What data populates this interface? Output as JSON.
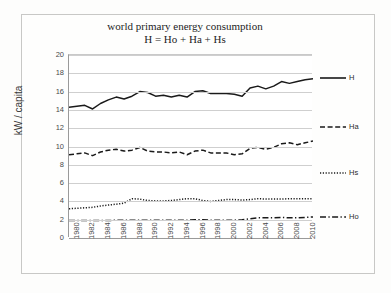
{
  "chart_data": {
    "type": "line",
    "title": "world primary energy consumption",
    "subtitle": "H = Ho + Ha + Hs",
    "xlabel": "",
    "ylabel": "kW / capita",
    "ylim": [
      0,
      20
    ],
    "xlim": [
      1980,
      2011
    ],
    "ytick_step": 2,
    "yticks": [
      "20",
      "18",
      "16",
      "14",
      "12",
      "10",
      "8",
      "6",
      "4",
      "2",
      "0"
    ],
    "xticks": [
      "1980",
      "1982",
      "1984",
      "1986",
      "1988",
      "1990",
      "1992",
      "1994",
      "1996",
      "1998",
      "2000",
      "2002",
      "2004",
      "2006",
      "2008",
      "2010"
    ],
    "grid": "horizontal",
    "legend_position": "right",
    "x": [
      1980,
      1981,
      1982,
      1983,
      1984,
      1985,
      1986,
      1987,
      1988,
      1989,
      1990,
      1991,
      1992,
      1993,
      1994,
      1995,
      1996,
      1997,
      1998,
      1999,
      2000,
      2001,
      2002,
      2003,
      2004,
      2005,
      2006,
      2007,
      2008,
      2009,
      2010,
      2011
    ],
    "series": [
      {
        "name": "H",
        "style": "solid",
        "color": "#1a1a1a",
        "values": [
          14.3,
          14.4,
          14.5,
          14.1,
          14.7,
          15.1,
          15.4,
          15.2,
          15.5,
          16.0,
          15.9,
          15.5,
          15.6,
          15.4,
          15.6,
          15.4,
          16.0,
          16.1,
          15.8,
          15.8,
          15.8,
          15.7,
          15.5,
          16.4,
          16.6,
          16.3,
          16.6,
          17.1,
          16.9,
          17.1,
          17.3,
          17.4
        ]
      },
      {
        "name": "Ha",
        "style": "dashed",
        "color": "#1a1a1a",
        "values": [
          9.1,
          9.2,
          9.3,
          9.0,
          9.4,
          9.6,
          9.7,
          9.5,
          9.6,
          9.9,
          9.5,
          9.4,
          9.4,
          9.3,
          9.4,
          9.1,
          9.5,
          9.6,
          9.3,
          9.3,
          9.3,
          9.1,
          9.2,
          9.8,
          9.9,
          9.7,
          9.9,
          10.3,
          10.4,
          10.2,
          10.4,
          10.6
        ]
      },
      {
        "name": "Hs",
        "style": "dotted",
        "color": "#1a1a1a",
        "values": [
          3.2,
          3.25,
          3.3,
          3.35,
          3.5,
          3.6,
          3.7,
          3.8,
          4.3,
          4.25,
          4.1,
          4.05,
          4.05,
          4.1,
          4.2,
          4.3,
          4.3,
          4.1,
          4.0,
          4.1,
          4.2,
          4.2,
          4.15,
          4.2,
          4.3,
          4.25,
          4.25,
          4.25,
          4.3,
          4.3,
          4.3,
          4.3
        ]
      },
      {
        "name": "Ho",
        "style": "dash-dot",
        "color": "#1a1a1a",
        "values": [
          1.9,
          1.9,
          1.9,
          1.9,
          1.9,
          1.9,
          1.95,
          1.95,
          1.95,
          1.95,
          1.95,
          1.95,
          1.95,
          1.95,
          1.95,
          1.95,
          2.0,
          2.0,
          1.95,
          1.95,
          1.95,
          1.95,
          2.0,
          2.1,
          2.2,
          2.2,
          2.2,
          2.25,
          2.2,
          2.2,
          2.25,
          2.3
        ]
      }
    ]
  },
  "legend": {
    "entries": [
      {
        "label": "H",
        "style": "solid"
      },
      {
        "label": "Ha",
        "style": "dashed"
      },
      {
        "label": "Hs",
        "style": "dotted"
      },
      {
        "label": "Ho",
        "style": "dash-dot"
      }
    ]
  }
}
